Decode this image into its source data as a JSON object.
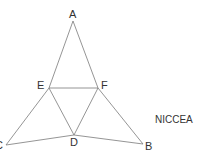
{
  "diagram": {
    "type": "geometry-figure",
    "vertices": {
      "A": {
        "label": "A",
        "x": 73,
        "y": 21
      },
      "E": {
        "label": "E",
        "x": 49,
        "y": 88
      },
      "F": {
        "label": "F",
        "x": 98,
        "y": 88
      },
      "C": {
        "label": "C",
        "x": 6,
        "y": 145
      },
      "D": {
        "label": "D",
        "x": 74,
        "y": 135
      },
      "B": {
        "label": "B",
        "x": 143,
        "y": 144
      }
    },
    "edges": [
      [
        "A",
        "E"
      ],
      [
        "E",
        "C"
      ],
      [
        "A",
        "F"
      ],
      [
        "F",
        "B"
      ],
      [
        "E",
        "F"
      ],
      [
        "E",
        "D"
      ],
      [
        "F",
        "D"
      ],
      [
        "C",
        "D"
      ],
      [
        "D",
        "B"
      ]
    ],
    "labels": {
      "A": "A",
      "B": "B",
      "C": "C",
      "D": "D",
      "E": "E",
      "F": "F"
    },
    "source_label": "NICCEA"
  },
  "colors": {
    "line": "#7a7a7a",
    "text": "#333333",
    "background": "#ffffff"
  }
}
